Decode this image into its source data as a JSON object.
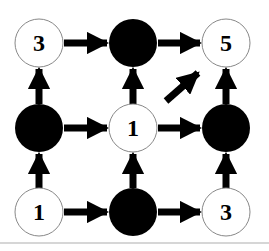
{
  "diagram": {
    "type": "grid-graph",
    "colors": {
      "filled": "#000000",
      "empty_fill": "#ffffff",
      "empty_stroke": "#888888",
      "arrow": "#000000",
      "baseline": "#c8c8c8"
    },
    "nodes": [
      {
        "id": "r0c0",
        "row": 0,
        "col": 0,
        "filled": false,
        "label": "3"
      },
      {
        "id": "r0c1",
        "row": 0,
        "col": 1,
        "filled": true,
        "label": ""
      },
      {
        "id": "r0c2",
        "row": 0,
        "col": 2,
        "filled": false,
        "label": "5"
      },
      {
        "id": "r1c0",
        "row": 1,
        "col": 0,
        "filled": true,
        "label": ""
      },
      {
        "id": "r1c1",
        "row": 1,
        "col": 1,
        "filled": false,
        "label": "1"
      },
      {
        "id": "r1c2",
        "row": 1,
        "col": 2,
        "filled": true,
        "label": ""
      },
      {
        "id": "r2c0",
        "row": 2,
        "col": 0,
        "filled": false,
        "label": "1"
      },
      {
        "id": "r2c1",
        "row": 2,
        "col": 1,
        "filled": true,
        "label": ""
      },
      {
        "id": "r2c2",
        "row": 2,
        "col": 2,
        "filled": false,
        "label": "3"
      }
    ],
    "edges": [
      {
        "from": "r0c0",
        "to": "r0c1",
        "direction": "right"
      },
      {
        "from": "r0c1",
        "to": "r0c2",
        "direction": "right"
      },
      {
        "from": "r1c0",
        "to": "r1c1",
        "direction": "right"
      },
      {
        "from": "r1c1",
        "to": "r1c2",
        "direction": "right"
      },
      {
        "from": "r2c0",
        "to": "r2c1",
        "direction": "right"
      },
      {
        "from": "r2c1",
        "to": "r2c2",
        "direction": "right"
      },
      {
        "from": "r1c0",
        "to": "r0c0",
        "direction": "up"
      },
      {
        "from": "r2c0",
        "to": "r1c0",
        "direction": "up"
      },
      {
        "from": "r1c1",
        "to": "r0c1",
        "direction": "up"
      },
      {
        "from": "r2c1",
        "to": "r1c1",
        "direction": "up"
      },
      {
        "from": "r1c2",
        "to": "r0c2",
        "direction": "up"
      },
      {
        "from": "r2c2",
        "to": "r1c2",
        "direction": "up"
      },
      {
        "from": "r1c1",
        "to": "r0c2",
        "direction": "diagonal-up-right"
      }
    ]
  }
}
